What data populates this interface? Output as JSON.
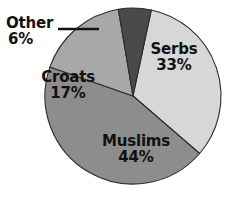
{
  "chart_data": {
    "type": "pie",
    "title": "",
    "subtitle": "",
    "xlabel": "",
    "ylabel": "",
    "legend_position": "none",
    "grid": false,
    "labels_on_slices": true,
    "categories": [
      "Serbs",
      "Muslims",
      "Croats",
      "Other"
    ],
    "values": [
      33,
      17,
      44,
      6
    ],
    "unit": "%",
    "slices": [
      {
        "label": "Serbs",
        "value": 33,
        "value_text": "33%",
        "color": "#d7d7d7",
        "start_angle_deg": 12,
        "end_angle_deg": 130.8,
        "label_placement": "inside"
      },
      {
        "label": "Muslims",
        "value": 44,
        "value_text": "44%",
        "color": "#8d8d8d",
        "start_angle_deg": 130.8,
        "end_angle_deg": 289.2,
        "label_placement": "inside"
      },
      {
        "label": "Croats",
        "value": 17,
        "value_text": "17%",
        "color": "#a8a8a8",
        "start_angle_deg": 289.2,
        "end_angle_deg": 350.4,
        "label_placement": "inside"
      },
      {
        "label": "Other",
        "value": 6,
        "value_text": "6%",
        "color": "#4a4a4a",
        "start_angle_deg": 350.4,
        "end_angle_deg": 12,
        "label_placement": "outside-leader"
      }
    ]
  },
  "geometry": {
    "center_x": 133,
    "center_y": 96,
    "radius": 88,
    "outline_color": "#2b2b2b",
    "background": "#ffffff",
    "leader": {
      "x1": 58,
      "y1": 29,
      "x2": 99,
      "y2": 29
    }
  },
  "labels": {
    "serbs": {
      "name": "Serbs",
      "value": "33%"
    },
    "muslims": {
      "name": "Muslims",
      "value": "44%"
    },
    "croats": {
      "name": "Croats",
      "value": "17%"
    },
    "other": {
      "name": "Other",
      "value": "6%"
    }
  }
}
